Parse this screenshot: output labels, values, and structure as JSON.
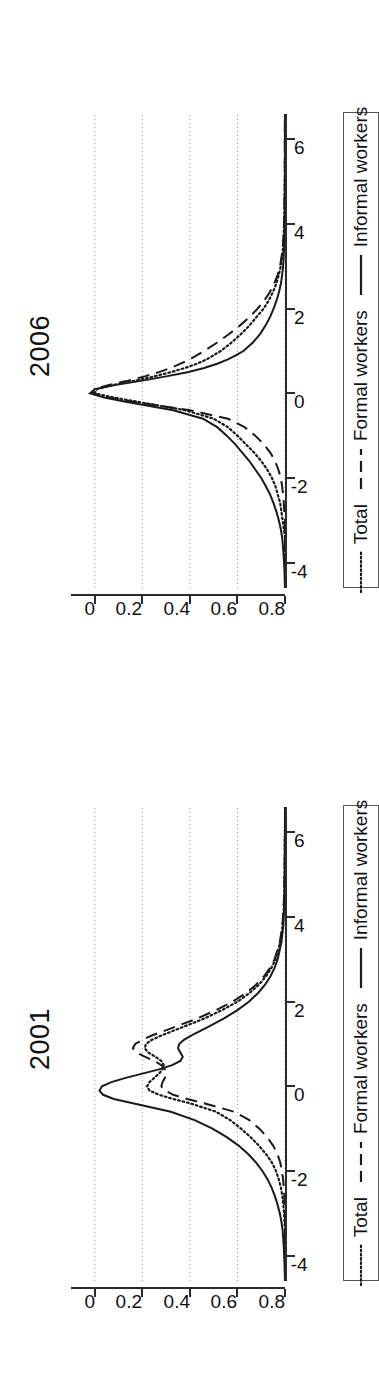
{
  "figure": {
    "orientation": "rotated-90-ccw",
    "background": "#ffffff",
    "ink": "#1a1a1a"
  },
  "legend": {
    "items": [
      {
        "label": "Total",
        "style": "dotted"
      },
      {
        "label": "Formal workers",
        "style": "dashed"
      },
      {
        "label": "Informal workers",
        "style": "solid"
      }
    ]
  },
  "panels": [
    {
      "id": "panel-2006",
      "title": "2006"
    },
    {
      "id": "panel-2001",
      "title": "2001"
    }
  ],
  "axes": {
    "x_ticks": [
      "-4",
      "-2",
      "0",
      "2",
      "4",
      "6"
    ],
    "y_ticks": [
      "0.8",
      "0.6",
      "0.4",
      "0.2",
      "0"
    ]
  },
  "chart_data": [
    {
      "type": "line",
      "title": "2006",
      "xlabel": "",
      "ylabel": "",
      "xlim": [
        -4.6,
        6.6
      ],
      "ylim": [
        0,
        0.9
      ],
      "x_ticks": [
        -4,
        -2,
        0,
        2,
        4,
        6
      ],
      "y_ticks": [
        0,
        0.2,
        0.4,
        0.6,
        0.8
      ],
      "grid": "dotted-vertical-at-y-ticks",
      "legend_position": "below",
      "x": [
        -4.6,
        -4.2,
        -3.8,
        -3.4,
        -3.2,
        -3.0,
        -2.8,
        -2.6,
        -2.4,
        -2.2,
        -2.0,
        -1.8,
        -1.6,
        -1.4,
        -1.2,
        -1.0,
        -0.8,
        -0.6,
        -0.4,
        -0.3,
        -0.2,
        -0.1,
        0.0,
        0.1,
        0.2,
        0.3,
        0.4,
        0.5,
        0.6,
        0.7,
        0.8,
        0.9,
        1.0,
        1.2,
        1.4,
        1.6,
        1.8,
        2.0,
        2.2,
        2.4,
        2.6,
        2.8,
        3.0,
        3.4,
        3.8,
        4.2,
        4.6,
        5.0,
        5.4,
        5.8,
        6.2,
        6.6
      ],
      "series": [
        {
          "name": "Total",
          "style": "dotted",
          "values": [
            0.0,
            0.0,
            0.0,
            0.0,
            0.005,
            0.01,
            0.015,
            0.02,
            0.03,
            0.04,
            0.055,
            0.075,
            0.1,
            0.13,
            0.165,
            0.2,
            0.24,
            0.3,
            0.42,
            0.52,
            0.62,
            0.72,
            0.8,
            0.79,
            0.72,
            0.63,
            0.55,
            0.48,
            0.42,
            0.37,
            0.33,
            0.3,
            0.27,
            0.225,
            0.185,
            0.15,
            0.12,
            0.09,
            0.068,
            0.05,
            0.036,
            0.026,
            0.018,
            0.009,
            0.005,
            0.003,
            0.002,
            0.001,
            0.001,
            0.0,
            0.0,
            0.0
          ]
        },
        {
          "name": "Formal workers",
          "style": "dashed",
          "values": [
            0.0,
            0.0,
            0.0,
            0.0,
            0.0,
            0.0,
            0.003,
            0.005,
            0.008,
            0.012,
            0.018,
            0.028,
            0.042,
            0.062,
            0.09,
            0.125,
            0.17,
            0.24,
            0.4,
            0.52,
            0.64,
            0.74,
            0.81,
            0.8,
            0.74,
            0.66,
            0.59,
            0.53,
            0.48,
            0.44,
            0.4,
            0.37,
            0.34,
            0.285,
            0.235,
            0.19,
            0.15,
            0.115,
            0.086,
            0.063,
            0.045,
            0.031,
            0.021,
            0.01,
            0.005,
            0.003,
            0.002,
            0.001,
            0.001,
            0.001,
            0.001,
            0.0
          ]
        },
        {
          "name": "Informal workers",
          "style": "solid",
          "values": [
            0.0,
            0.002,
            0.006,
            0.012,
            0.018,
            0.026,
            0.036,
            0.048,
            0.062,
            0.08,
            0.1,
            0.125,
            0.15,
            0.18,
            0.21,
            0.245,
            0.285,
            0.345,
            0.47,
            0.57,
            0.67,
            0.76,
            0.82,
            0.8,
            0.71,
            0.6,
            0.5,
            0.41,
            0.34,
            0.285,
            0.24,
            0.205,
            0.175,
            0.135,
            0.105,
            0.082,
            0.063,
            0.048,
            0.035,
            0.025,
            0.017,
            0.012,
            0.008,
            0.004,
            0.002,
            0.001,
            0.001,
            0.0,
            0.0,
            0.0,
            0.0,
            0.0
          ]
        }
      ]
    },
    {
      "type": "line",
      "title": "2001",
      "xlabel": "",
      "ylabel": "",
      "xlim": [
        -4.6,
        6.6
      ],
      "ylim": [
        0,
        0.9
      ],
      "x_ticks": [
        -4,
        -2,
        0,
        2,
        4,
        6
      ],
      "y_ticks": [
        0,
        0.2,
        0.4,
        0.6,
        0.8
      ],
      "grid": "dotted-vertical-at-y-ticks",
      "legend_position": "below",
      "x": [
        -4.6,
        -4.2,
        -3.8,
        -3.4,
        -3.2,
        -3.0,
        -2.8,
        -2.6,
        -2.4,
        -2.2,
        -2.0,
        -1.8,
        -1.6,
        -1.4,
        -1.2,
        -1.0,
        -0.8,
        -0.6,
        -0.4,
        -0.3,
        -0.2,
        -0.1,
        0.0,
        0.1,
        0.2,
        0.3,
        0.4,
        0.5,
        0.6,
        0.7,
        0.8,
        0.9,
        1.0,
        1.1,
        1.2,
        1.4,
        1.6,
        1.8,
        2.0,
        2.2,
        2.4,
        2.6,
        2.8,
        3.0,
        3.4,
        3.8,
        4.2,
        4.6,
        5.0,
        5.4,
        5.8,
        6.2,
        6.6
      ],
      "series": [
        {
          "name": "Total",
          "style": "dotted",
          "values": [
            0.0,
            0.0,
            0.0,
            0.0,
            0.002,
            0.004,
            0.007,
            0.011,
            0.017,
            0.026,
            0.038,
            0.055,
            0.08,
            0.11,
            0.145,
            0.185,
            0.23,
            0.29,
            0.4,
            0.47,
            0.53,
            0.57,
            0.58,
            0.57,
            0.55,
            0.53,
            0.515,
            0.51,
            0.52,
            0.545,
            0.575,
            0.59,
            0.585,
            0.56,
            0.52,
            0.43,
            0.34,
            0.265,
            0.2,
            0.15,
            0.11,
            0.08,
            0.057,
            0.04,
            0.02,
            0.01,
            0.005,
            0.003,
            0.002,
            0.001,
            0.001,
            0.0,
            0.0
          ]
        },
        {
          "name": "Formal workers",
          "style": "dashed",
          "values": [
            0.0,
            0.0,
            0.0,
            0.0,
            0.0,
            0.0,
            0.002,
            0.003,
            0.005,
            0.008,
            0.013,
            0.02,
            0.032,
            0.05,
            0.075,
            0.108,
            0.15,
            0.215,
            0.34,
            0.41,
            0.47,
            0.505,
            0.52,
            0.515,
            0.505,
            0.5,
            0.505,
            0.52,
            0.55,
            0.59,
            0.625,
            0.64,
            0.63,
            0.6,
            0.56,
            0.465,
            0.37,
            0.29,
            0.22,
            0.165,
            0.122,
            0.088,
            0.063,
            0.044,
            0.022,
            0.011,
            0.006,
            0.003,
            0.002,
            0.001,
            0.001,
            0.0,
            0.0
          ]
        },
        {
          "name": "Informal workers",
          "style": "solid",
          "values": [
            0.0,
            0.002,
            0.005,
            0.01,
            0.015,
            0.022,
            0.031,
            0.042,
            0.056,
            0.073,
            0.095,
            0.122,
            0.155,
            0.195,
            0.245,
            0.305,
            0.38,
            0.48,
            0.64,
            0.72,
            0.765,
            0.78,
            0.77,
            0.73,
            0.67,
            0.6,
            0.53,
            0.475,
            0.44,
            0.43,
            0.44,
            0.45,
            0.445,
            0.425,
            0.395,
            0.325,
            0.258,
            0.2,
            0.152,
            0.114,
            0.084,
            0.061,
            0.044,
            0.031,
            0.015,
            0.007,
            0.004,
            0.002,
            0.001,
            0.001,
            0.0,
            0.0,
            0.0
          ]
        }
      ]
    }
  ]
}
